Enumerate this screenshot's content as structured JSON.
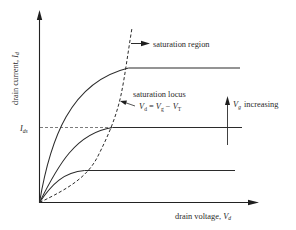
{
  "figure": {
    "axes": {
      "y_label_text": "drain current, ",
      "y_label_symbol": "I",
      "y_label_subscript": "d",
      "x_label_text": "drain voltage, ",
      "x_label_symbol": "V",
      "x_label_subscript": "d",
      "y_tick_symbol": "I",
      "y_tick_subscript": "ds"
    },
    "annotations": {
      "saturation_region": "saturation region",
      "saturation_locus": "saturation locus",
      "locus_eq_lhs_symbol": "V",
      "locus_eq_lhs_sub": "d",
      "locus_eq_mid": " = ",
      "locus_eq_v1_symbol": "V",
      "locus_eq_v1_sub": "g",
      "locus_eq_minus": " − ",
      "locus_eq_v2_symbol": "V",
      "locus_eq_v2_sub": "T",
      "vg_symbol": "V",
      "vg_sub": "g",
      "vg_increasing": "increasing"
    },
    "curves": [
      {
        "name": "low Vg",
        "saturation_current_level": "low"
      },
      {
        "name": "mid Vg",
        "saturation_current_level": "I_ds"
      },
      {
        "name": "high Vg",
        "saturation_current_level": "high"
      }
    ],
    "colors": {
      "line": "#2b2b2b",
      "text": "#2a2a2a",
      "background": "#ffffff"
    }
  }
}
